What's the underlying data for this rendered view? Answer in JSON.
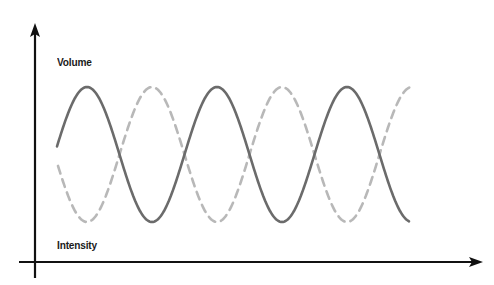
{
  "chart_data": {
    "type": "line",
    "title": "",
    "ylabel": "Volume",
    "xlabel": "Intensity",
    "grid": false,
    "legend": null,
    "axes": {
      "origin": [
        35,
        262
      ],
      "y_axis_top": 24,
      "y_axis_bottom": 278,
      "x_axis_left": 19,
      "x_axis_right": 482
    },
    "series": [
      {
        "name": "solid-wave",
        "style": "solid",
        "color": "#6b6b6b",
        "function": "sine",
        "x_start": 57,
        "x_end": 409,
        "center_y": 154.5,
        "amplitude": 67.5,
        "period": 130,
        "phase_note": "starts mid-rising, first peak at x=87",
        "peaks_x": [
          87,
          216,
          346
        ],
        "troughs_x": [
          151,
          281,
          409
        ]
      },
      {
        "name": "dashed-wave",
        "style": "dashed",
        "color": "#b8b8b8",
        "function": "sine-inverted",
        "x_start": 58,
        "x_end": 410,
        "center_y": 154.5,
        "amplitude": 67.5,
        "period": 130,
        "phase_note": "inverted copy of solid wave, first trough at x=87",
        "peaks_x": [
          151,
          281,
          410
        ],
        "troughs_x": [
          87,
          216,
          346
        ]
      }
    ]
  },
  "labels": {
    "y_axis": "Volume",
    "x_axis": "Intensity"
  },
  "colors": {
    "axis": "#111111",
    "solid_wave": "#6b6b6b",
    "dashed_wave": "#b8b8b8",
    "background": "#ffffff"
  }
}
